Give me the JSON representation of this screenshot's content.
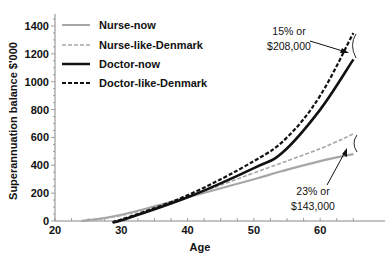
{
  "chart_data": {
    "type": "line",
    "title": "",
    "xlabel": "Age",
    "ylabel": "Superannuation balance $'000",
    "xlim": [
      20,
      67
    ],
    "ylim": [
      0,
      1450
    ],
    "x_ticks": [
      20,
      30,
      40,
      50,
      60
    ],
    "y_ticks": [
      0,
      200,
      400,
      600,
      800,
      1000,
      1200,
      1400
    ],
    "grid": false,
    "legend_position": "upper-left",
    "series": [
      {
        "name": "Nurse-now",
        "style": "solid",
        "color": "#a6a6a6",
        "x": [
          24,
          30,
          40,
          50,
          54,
          60,
          65
        ],
        "values": [
          0,
          45,
          170,
          300,
          355,
          430,
          480
        ]
      },
      {
        "name": "Nurse-like-Denmark",
        "style": "dashed",
        "color": "#a6a6a6",
        "x": [
          24,
          30,
          40,
          50,
          60,
          65
        ],
        "values": [
          0,
          40,
          175,
          345,
          520,
          625
        ]
      },
      {
        "name": "Doctor-now",
        "style": "solid",
        "color": "#111111",
        "x": [
          29,
          30,
          40,
          50,
          54.4,
          60,
          65
        ],
        "values": [
          0,
          5,
          170,
          380,
          495,
          800,
          1160
        ]
      },
      {
        "name": "Doctor-like-Denmark",
        "style": "dashed",
        "color": "#111111",
        "x": [
          29,
          30,
          40,
          50,
          55,
          60,
          65
        ],
        "values": [
          0,
          10,
          185,
          430,
          600,
          900,
          1350
        ]
      }
    ],
    "annotations": [
      {
        "line1": "15% or",
        "line2": "$208,000",
        "target": "doctor-gap-at-65"
      },
      {
        "line1": "23% or",
        "line2": "$143,000",
        "target": "nurse-gap-at-65"
      }
    ]
  }
}
